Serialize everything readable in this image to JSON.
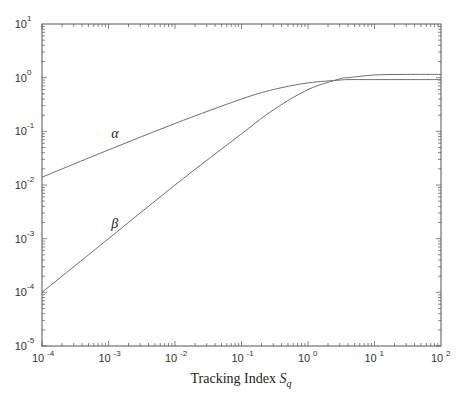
{
  "chart_data": {
    "type": "line",
    "title": "",
    "xlabel": "Tracking Index S_q",
    "xlabel_main": "Tracking Index ",
    "xlabel_symbol": "S",
    "xlabel_subscript": "q",
    "ylabel": "",
    "xscale": "log",
    "yscale": "log",
    "xlim": [
      0.0001,
      100
    ],
    "ylim": [
      1e-05,
      10
    ],
    "grid": false,
    "legend": "none (inline curve labels)",
    "x_ticks": [
      {
        "base": "10",
        "exp": "-4",
        "value": 0.0001
      },
      {
        "base": "10",
        "exp": "-3",
        "value": 0.001
      },
      {
        "base": "10",
        "exp": "-2",
        "value": 0.01
      },
      {
        "base": "10",
        "exp": "-1",
        "value": 0.1
      },
      {
        "base": "10",
        "exp": "0",
        "value": 1
      },
      {
        "base": "10",
        "exp": "1",
        "value": 10
      },
      {
        "base": "10",
        "exp": "2",
        "value": 100
      }
    ],
    "y_ticks": [
      {
        "base": "10",
        "exp": "1",
        "value": 10
      },
      {
        "base": "10",
        "exp": "0",
        "value": 1
      },
      {
        "base": "10",
        "exp": "-1",
        "value": 0.1
      },
      {
        "base": "10",
        "exp": "-2",
        "value": 0.01
      },
      {
        "base": "10",
        "exp": "-3",
        "value": 0.001
      },
      {
        "base": "10",
        "exp": "-4",
        "value": 0.0001
      },
      {
        "base": "10",
        "exp": "-5",
        "value": 1e-05
      }
    ],
    "x": [
      0.0001,
      0.001,
      0.01,
      0.1,
      0.3,
      1,
      3,
      4,
      10,
      30,
      100
    ],
    "series": [
      {
        "name": "α",
        "label": "α",
        "label_at": {
          "x": 0.0011,
          "y": 0.075
        },
        "values": [
          0.014,
          0.045,
          0.14,
          0.4,
          0.6,
          0.8,
          0.9,
          0.92,
          0.92,
          0.92,
          0.92
        ]
      },
      {
        "name": "β",
        "label": "β",
        "label_at": {
          "x": 0.0011,
          "y": 0.0016
        },
        "values": [
          0.0001,
          0.001,
          0.01,
          0.09,
          0.25,
          0.6,
          0.95,
          1.0,
          1.12,
          1.15,
          1.15
        ]
      }
    ]
  },
  "colors": {
    "axis": "#555555",
    "curve": "#6e6e6e",
    "text": "#222222"
  }
}
